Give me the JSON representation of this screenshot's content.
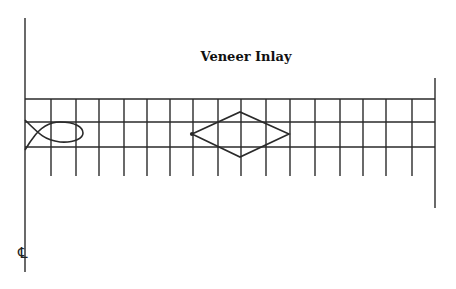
{
  "title": "Veneer Inlay",
  "centerline_label": "℄",
  "colors": {
    "stroke": "#2a2a2a",
    "background": "#ffffff"
  },
  "diagram": {
    "left_centerline": {
      "x": 25,
      "y1": 18,
      "y2": 272
    },
    "right_border": {
      "x": 435,
      "y1": 78,
      "y2": 208
    },
    "horizontal_lines_y": [
      99,
      122,
      147
    ],
    "vertical_lines_x": [
      51,
      76,
      99,
      124,
      147,
      170,
      193,
      218,
      241,
      266,
      290,
      315,
      340,
      363,
      386,
      412
    ],
    "vertical_tick_bottom": 176,
    "shapes": [
      {
        "name": "fish",
        "type": "fish"
      },
      {
        "name": "diamond",
        "type": "diamond",
        "points": [
          [
            192,
            134
          ],
          [
            240,
            112
          ],
          [
            289,
            134
          ],
          [
            240,
            157
          ]
        ]
      }
    ]
  }
}
